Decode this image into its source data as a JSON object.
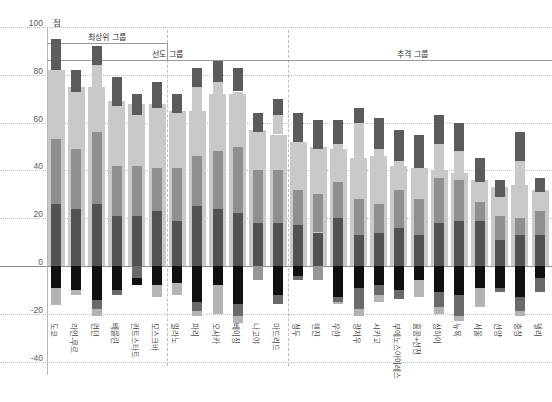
{
  "chart_data": {
    "type": "bar",
    "unit_label": "점",
    "ylim": [
      -40,
      100
    ],
    "yticks": [
      100,
      80,
      60,
      40,
      20,
      0,
      -20,
      -40
    ],
    "grid": true,
    "groups": [
      {
        "label": "최상위 그룹",
        "from": 0,
        "to": 5
      },
      {
        "label": "선도 그룹",
        "from": 6,
        "to": 11
      },
      {
        "label": "추격 그룹",
        "from": 12,
        "to": 24
      }
    ],
    "colors": {
      "wide": "#c9c9c9",
      "narrow_light": "#c9c9c9",
      "cap": "#5b5b5b",
      "mid": "#8f8f8f",
      "dark": "#525252",
      "neg_black": "#101010",
      "neg_dark": "#6a6a6a",
      "neg_mid": "#969696",
      "neg_light": "#b4b4b4"
    },
    "series_note": "total=wide light bar top; cap=[lo,hi] dark narrow range bar; mid=[lo,hi] medium narrow segment (dark segment runs mid.lo to 0); neg=stacked segments below zero",
    "cities": [
      {
        "name": "도쿄",
        "total": 82,
        "cap": [
          82,
          95
        ],
        "mid": [
          26,
          53
        ],
        "neg": [
          [
            "black",
            -9
          ],
          [
            "light",
            -16.5
          ]
        ]
      },
      {
        "name": "라인-루르",
        "total": 75,
        "cap": [
          73,
          82
        ],
        "mid": [
          24,
          49
        ],
        "neg": [
          [
            "black",
            -10
          ],
          [
            "light",
            -12
          ]
        ]
      },
      {
        "name": "런던",
        "total": 75,
        "cap": [
          84,
          92
        ],
        "mid": [
          26,
          56
        ],
        "neg": [
          [
            "black",
            -14
          ],
          [
            "dark",
            -18
          ],
          [
            "light",
            -21
          ]
        ]
      },
      {
        "name": "베를린",
        "total": 69,
        "cap": [
          67,
          79
        ],
        "mid": [
          21,
          42
        ],
        "neg": [
          [
            "black",
            -10
          ],
          [
            "dark",
            -12
          ]
        ]
      },
      {
        "name": "란트스타트",
        "total": 68,
        "cap": [
          63,
          72
        ],
        "mid": [
          21,
          42
        ],
        "neg": [
          [
            "dark",
            -5
          ],
          [
            "black",
            -8
          ]
        ]
      },
      {
        "name": "모스크바",
        "total": 68,
        "cap": [
          66,
          77
        ],
        "mid": [
          23,
          41
        ],
        "neg": [
          [
            "black",
            -8
          ],
          [
            "light",
            -13
          ]
        ]
      },
      {
        "name": "밀라노",
        "total": 65,
        "cap": [
          64,
          72
        ],
        "mid": [
          19,
          41
        ],
        "neg": [
          [
            "black",
            -7
          ],
          [
            "light",
            -12
          ]
        ]
      },
      {
        "name": "파리",
        "total": 65,
        "cap": [
          75,
          83
        ],
        "mid": [
          25,
          46
        ],
        "neg": [
          [
            "black",
            -15
          ],
          [
            "dark",
            -19
          ],
          [
            "light",
            -21
          ]
        ]
      },
      {
        "name": "오사카",
        "total": 72,
        "cap": [
          77,
          86
        ],
        "mid": [
          24,
          48
        ],
        "neg": [
          [
            "black",
            -8
          ],
          [
            "light",
            -20
          ]
        ]
      },
      {
        "name": "베이징",
        "total": 72,
        "cap": [
          73,
          83
        ],
        "mid": [
          22,
          50
        ],
        "neg": [
          [
            "black",
            -16
          ],
          [
            "dark",
            -21
          ],
          [
            "light",
            -24
          ]
        ]
      },
      {
        "name": "나고야",
        "total": 57,
        "cap": [
          56,
          64
        ],
        "mid": [
          18,
          40
        ],
        "neg": [
          [
            "mid",
            -6
          ]
        ]
      },
      {
        "name": "마드리드",
        "total": 55,
        "cap": [
          63,
          70
        ],
        "mid": [
          18,
          40
        ],
        "neg": [
          [
            "black",
            -12
          ],
          [
            "dark",
            -16
          ]
        ]
      },
      {
        "name": "청두",
        "total": 52,
        "cap": [
          52,
          64
        ],
        "mid": [
          17,
          32
        ],
        "neg": [
          [
            "black",
            -4
          ],
          [
            "dark",
            -6
          ]
        ]
      },
      {
        "name": "톈진",
        "total": 50,
        "cap": [
          49,
          61
        ],
        "mid": [
          14,
          30
        ],
        "neg": [
          [
            "mid",
            -6
          ]
        ]
      },
      {
        "name": "우한",
        "total": 49,
        "cap": [
          51,
          61
        ],
        "mid": [
          20,
          35
        ],
        "neg": [
          [
            "black",
            -13
          ],
          [
            "dark",
            -15
          ],
          [
            "light",
            -16
          ]
        ]
      },
      {
        "name": "광저우",
        "total": 45,
        "cap": [
          60,
          66
        ],
        "mid": [
          13,
          28
        ],
        "neg": [
          [
            "black",
            -9
          ],
          [
            "dark",
            -18
          ],
          [
            "light",
            -21
          ]
        ]
      },
      {
        "name": "시카고",
        "total": 46,
        "cap": [
          49,
          62
        ],
        "mid": [
          14,
          26
        ],
        "neg": [
          [
            "black",
            -8
          ],
          [
            "dark",
            -12
          ],
          [
            "light",
            -15
          ]
        ]
      },
      {
        "name": "부에노스아이레스",
        "total": 42,
        "cap": [
          44,
          57
        ],
        "mid": [
          16,
          32
        ],
        "neg": [
          [
            "black",
            -10
          ],
          [
            "dark",
            -14
          ]
        ]
      },
      {
        "name": "홍콩+선전",
        "total": 41,
        "cap": [
          41,
          55
        ],
        "mid": [
          13,
          28
        ],
        "neg": [
          [
            "black",
            -6
          ],
          [
            "light",
            -13
          ]
        ]
      },
      {
        "name": "상하이",
        "total": 40,
        "cap": [
          51,
          63
        ],
        "mid": [
          18,
          37
        ],
        "neg": [
          [
            "black",
            -11
          ],
          [
            "dark",
            -17
          ],
          [
            "light",
            -20
          ]
        ]
      },
      {
        "name": "뉴욕",
        "total": 39,
        "cap": [
          48,
          60
        ],
        "mid": [
          19,
          36
        ],
        "neg": [
          [
            "black",
            -12
          ],
          [
            "dark",
            -21
          ],
          [
            "light",
            -23
          ]
        ]
      },
      {
        "name": "서울",
        "total": 36,
        "cap": [
          35,
          45
        ],
        "mid": [
          19,
          27
        ],
        "neg": [
          [
            "black",
            -9
          ],
          [
            "light",
            -17
          ]
        ]
      },
      {
        "name": "선양",
        "total": 33,
        "cap": [
          29,
          36
        ],
        "mid": [
          11,
          21
        ],
        "neg": [
          [
            "black",
            -9
          ],
          [
            "dark",
            -11
          ]
        ]
      },
      {
        "name": "충칭",
        "total": 34,
        "cap": [
          44,
          56
        ],
        "mid": [
          13,
          20
        ],
        "neg": [
          [
            "black",
            -13
          ],
          [
            "dark",
            -19
          ],
          [
            "light",
            -21
          ]
        ]
      },
      {
        "name": "델리",
        "total": 32,
        "cap": [
          31,
          37
        ],
        "mid": [
          13,
          23
        ],
        "neg": [
          [
            "black",
            -5
          ],
          [
            "dark",
            -11
          ]
        ]
      }
    ]
  }
}
